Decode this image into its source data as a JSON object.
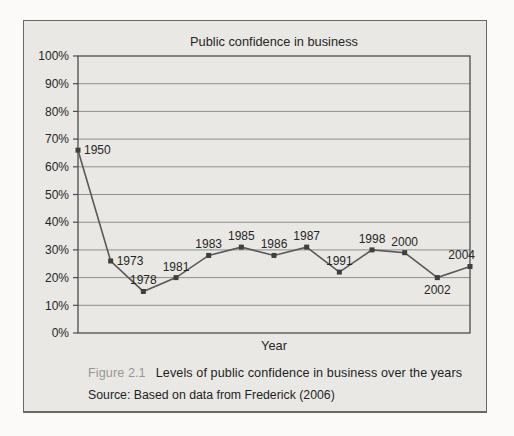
{
  "page": {
    "background": "#fbfaf8"
  },
  "figure_box": {
    "background": "#e9e8e4",
    "border_color": "#686868"
  },
  "chart_data": {
    "type": "line",
    "title": "Public confidence in business",
    "xlabel": "Year",
    "ylabel": "",
    "categories": [
      "1950",
      "1973",
      "1978",
      "1981",
      "1983",
      "1985",
      "1986",
      "1987",
      "1991",
      "1998",
      "2000",
      "2002",
      "2004"
    ],
    "values": [
      66,
      26,
      15,
      20,
      28,
      31,
      28,
      31,
      22,
      30,
      29,
      20,
      24
    ],
    "ylim": [
      0,
      100
    ],
    "ytick_step": 10,
    "ytick_labels": [
      "0%",
      "10%",
      "20%",
      "30%",
      "40%",
      "50%",
      "60%",
      "70%",
      "80%",
      "90%",
      "100%"
    ],
    "grid": true,
    "legend": "none",
    "label_positions": [
      "right",
      "right",
      "above",
      "above",
      "above",
      "above",
      "above",
      "above",
      "above",
      "above",
      "above",
      "below",
      "above-left"
    ],
    "styles": {
      "line_color": "#595959",
      "marker_color": "#3f3f3f",
      "marker": "square",
      "grid_color": "#8f8f8f",
      "axis_color": "#4d4d4d",
      "text_color": "#262626"
    }
  },
  "caption": {
    "label": "Figure 2.1",
    "text": "Levels of public confidence in business over the years"
  },
  "source": {
    "text": "Source: Based on data from Frederick (2006)"
  }
}
